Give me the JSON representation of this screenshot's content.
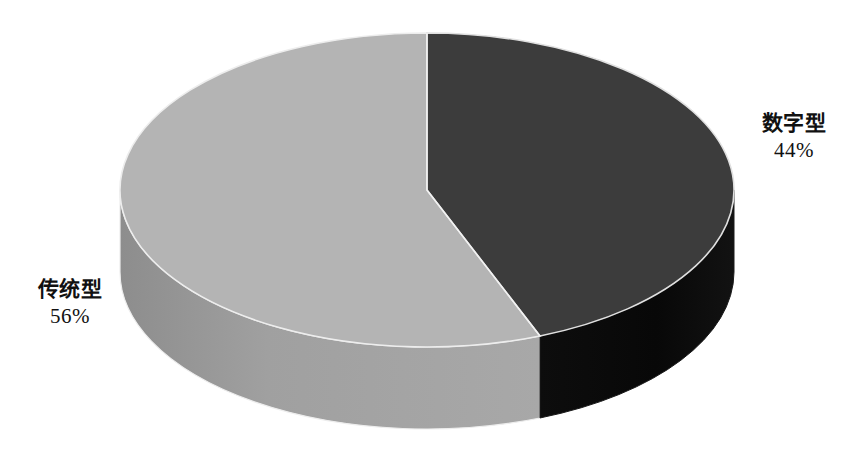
{
  "chart_data": {
    "type": "pie",
    "title": "",
    "subtitle": "",
    "xlabel": "",
    "ylabel": "",
    "grid": false,
    "legend_position": "none",
    "three_d": true,
    "start_angle_deg": 0,
    "direction": "clockwise",
    "categories": [
      "数字型",
      "传统型"
    ],
    "values": [
      44,
      56
    ],
    "value_unit": "%",
    "labels": [
      "数字型 44%",
      "传统型 56%"
    ],
    "slices": [
      {
        "name": "数字型",
        "percent": "44%",
        "value": 44,
        "top_color": "#3c3c3c",
        "side_color": "#0a0a0a",
        "position": "right"
      },
      {
        "name": "传统型",
        "percent": "56%",
        "value": 56,
        "top_color": "#b4b4b4",
        "side_color": "#9a9a9a",
        "position": "left"
      }
    ]
  },
  "labels": {
    "right": {
      "category": "数字型",
      "percent": "44%"
    },
    "left": {
      "category": "传统型",
      "percent": "56%"
    }
  },
  "colors": {
    "background": "#ffffff",
    "digital_top": "#3c3c3c",
    "digital_side": "#0a0a0a",
    "traditional_top": "#b4b4b4",
    "traditional_side": "#9a9a9a",
    "outline": "#e8e8e8",
    "text": "#111111"
  }
}
